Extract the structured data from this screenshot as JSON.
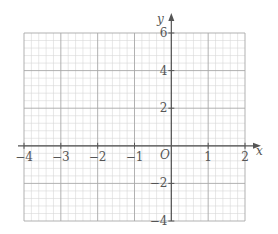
{
  "chart_data": {
    "type": "coordinate-grid",
    "title": "",
    "xlabel": "x",
    "ylabel": "y",
    "origin_label": "O",
    "xlim": [
      -4,
      2
    ],
    "ylim": [
      -4,
      6
    ],
    "x_ticks": [
      -4,
      -3,
      -2,
      -1,
      1,
      2
    ],
    "x_tick_labels": [
      "−4",
      "−3",
      "−2",
      "−1",
      "1",
      "2"
    ],
    "y_ticks": [
      -4,
      -2,
      2,
      4,
      6
    ],
    "y_tick_labels": [
      "−4",
      "−2",
      "2",
      "4",
      "6"
    ],
    "x_minor_per_unit": 5,
    "y_minor_per_2units": 5,
    "grid": true,
    "series": []
  },
  "colors": {
    "minor_grid": "#d6d6d6",
    "major_grid": "#a8a8a8",
    "axis": "#555555",
    "label": "#555555"
  }
}
